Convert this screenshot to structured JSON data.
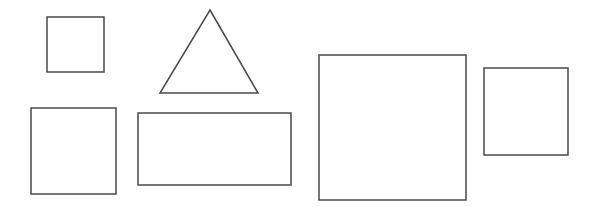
{
  "canvas": {
    "width": 594,
    "height": 207,
    "background_color": "#ffffff",
    "stroke_color": "#4a4a4a",
    "stroke_width": 1.5,
    "fill": "none",
    "shape_count": 6
  },
  "shapes": [
    {
      "id": "square-small-top-left",
      "kind": "square",
      "label": "Small square",
      "x": 47,
      "y": 17,
      "width": 57,
      "height": 55,
      "points": "47,17 104,17 104,72 47,72"
    },
    {
      "id": "triangle-top-center",
      "kind": "triangle",
      "label": "Triangle",
      "apex_x": 210,
      "apex_y": 10,
      "base_left_x": 160,
      "base_right_x": 258,
      "base_y": 93,
      "width": 98,
      "height": 83,
      "points": "210,10 258,93 160,93"
    },
    {
      "id": "square-medium-bottom-left",
      "kind": "square",
      "label": "Medium square",
      "x": 31,
      "y": 108,
      "width": 85,
      "height": 86,
      "points": "31,108 116,108 116,194 31,194"
    },
    {
      "id": "rectangle-wide-bottom-center",
      "kind": "rectangle",
      "label": "Wide rectangle",
      "x": 138,
      "y": 113,
      "width": 153,
      "height": 72,
      "points": "138,113 291,113 291,185 138,185"
    },
    {
      "id": "square-large-right",
      "kind": "square",
      "label": "Large square",
      "x": 319,
      "y": 55,
      "width": 147,
      "height": 145,
      "points": "319,55 466,55 466,200 319,200"
    },
    {
      "id": "square-small-far-right",
      "kind": "square",
      "label": "Far right square",
      "x": 484,
      "y": 68,
      "width": 84,
      "height": 87,
      "points": "484,68 568,68 568,155 484,155"
    }
  ]
}
